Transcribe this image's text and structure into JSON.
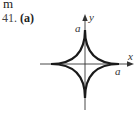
{
  "page_fragment": {
    "top_text": "m"
  },
  "problem": {
    "number": "41.",
    "part": "(a)"
  },
  "figure": {
    "curve": "astroid",
    "axes": {
      "x_label": "x",
      "y_label": "y"
    },
    "intercept_labels": {
      "y_intercept": "a",
      "x_intercept": "a"
    },
    "colors": {
      "curve": "#1a1a1a",
      "axes": "#333333"
    }
  }
}
